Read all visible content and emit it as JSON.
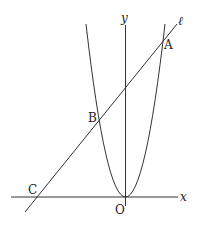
{
  "diagram": {
    "labels": {
      "y_axis": "y",
      "x_axis": "x",
      "line": "ℓ",
      "point_A": "A",
      "point_B": "B",
      "point_C": "C",
      "origin": "O"
    },
    "colors": {
      "stroke": "#333333",
      "background": "#ffffff"
    }
  }
}
